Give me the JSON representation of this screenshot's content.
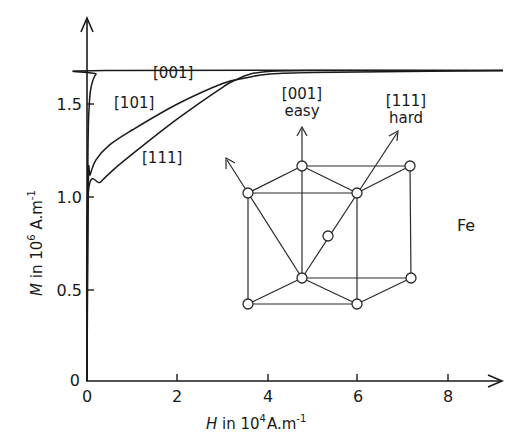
{
  "chart_data": {
    "type": "line",
    "title": "",
    "xlabel": "H in 10^4 A.m^-1",
    "ylabel": "M in 10^6 A.m^-1",
    "xlim": [
      0,
      9.3
    ],
    "ylim": [
      0,
      1.9
    ],
    "grid": false,
    "legend": "inline labels",
    "x_ticks": [
      0,
      2,
      4,
      6,
      8
    ],
    "y_ticks": [
      0,
      0.5,
      1.0,
      1.5
    ],
    "x_tick_labels": [
      "0",
      "2",
      "4",
      "6",
      "8"
    ],
    "y_tick_labels": [
      "0",
      "0.5",
      "1.0",
      "1.5"
    ],
    "series": [
      {
        "name": "[001]",
        "x": [
          0,
          0.02,
          0.05,
          0.1,
          0.2,
          0.4,
          9.2
        ],
        "y": [
          0,
          1.2,
          1.5,
          1.6,
          1.66,
          1.68,
          1.68
        ]
      },
      {
        "name": "[101]",
        "x": [
          0,
          0.03,
          0.07,
          0.2,
          0.5,
          1.0,
          2.0,
          3.0,
          3.5,
          4.0,
          5.0,
          9.2
        ],
        "y": [
          0,
          1.08,
          1.12,
          1.2,
          1.28,
          1.36,
          1.5,
          1.61,
          1.64,
          1.66,
          1.67,
          1.68
        ]
      },
      {
        "name": "[111]",
        "x": [
          0,
          0.02,
          0.3,
          0.6,
          1.0,
          2.0,
          3.0,
          3.3,
          3.6,
          4.0,
          5.0,
          9.2
        ],
        "y": [
          0,
          1.0,
          1.08,
          1.15,
          1.23,
          1.42,
          1.59,
          1.63,
          1.66,
          1.675,
          1.68,
          1.68
        ]
      }
    ],
    "annotations": [
      {
        "text": "[001]",
        "x": 3.15,
        "y": 1.76
      },
      {
        "text": "[101]",
        "x": 0.65,
        "y": 1.51
      },
      {
        "text": "[111]",
        "x": 1.22,
        "y": 1.15
      },
      {
        "text": "[001]",
        "x": 3.9,
        "y": 1.55,
        "note": "easy axis label"
      },
      {
        "text": "easy",
        "x": 3.9,
        "y": 1.47
      },
      {
        "text": "[111]",
        "x": 6.3,
        "y": 1.48
      },
      {
        "text": "hard",
        "x": 6.3,
        "y": 1.39
      },
      {
        "text": "Fe",
        "x": 8.2,
        "y": 0.84
      }
    ]
  },
  "labels": {
    "sat001": "[001]",
    "c101": "[101]",
    "c111": "[111]",
    "easy_dir": "[001]",
    "easy": "easy",
    "hard_dir": "[111]",
    "hard": "hard",
    "element": "Fe",
    "x_axis_var": "H",
    "x_axis_unit_a": " in 10",
    "x_axis_exp": "4",
    "x_axis_unit_b": "A.m",
    "x_axis_unit_exp": "-1",
    "y_axis_var": "M",
    "y_axis_unit_a": " in 10",
    "y_axis_exp": "6",
    "y_axis_unit_b": " A.m",
    "y_axis_unit_exp": "-1"
  },
  "ticks": {
    "x": [
      "0",
      "2",
      "4",
      "6",
      "8"
    ],
    "y": [
      "0",
      "0.5",
      "1.0",
      "1.5"
    ]
  },
  "lattice": {
    "nodes": [
      {
        "id": "back-top-left",
        "x": 302,
        "y": 166
      },
      {
        "id": "back-top-right",
        "x": 410,
        "y": 166
      },
      {
        "id": "front-top-left",
        "x": 248,
        "y": 193
      },
      {
        "id": "front-top-right",
        "x": 357,
        "y": 193
      },
      {
        "id": "body-center",
        "x": 328,
        "y": 236
      },
      {
        "id": "back-bottom-left",
        "x": 302,
        "y": 278
      },
      {
        "id": "back-bottom-right",
        "x": 411,
        "y": 278
      },
      {
        "id": "front-bottom-left",
        "x": 248,
        "y": 304
      },
      {
        "id": "front-bottom-right",
        "x": 357,
        "y": 304
      }
    ]
  }
}
